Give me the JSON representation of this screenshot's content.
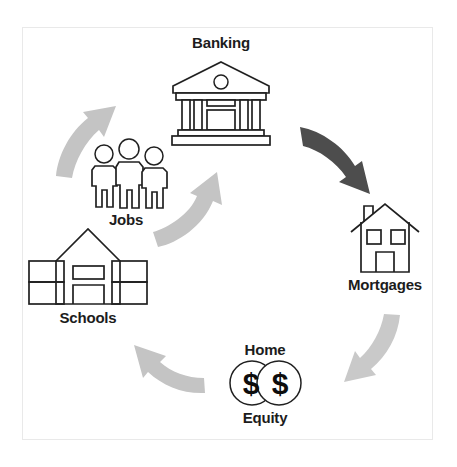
{
  "diagram": {
    "type": "cycle-diagram",
    "title": "",
    "background_color": "#ffffff",
    "frame_color": "#e9e9e9",
    "nodes": [
      {
        "id": "banking",
        "label": "Banking",
        "icon": "bank-building-icon",
        "label_position": "above",
        "cx": 221,
        "cy": 98
      },
      {
        "id": "mortgages",
        "label": "Mortgages",
        "icon": "house-icon",
        "label_position": "below",
        "cx": 385,
        "cy": 243
      },
      {
        "id": "home-equity",
        "label_top": "Home",
        "label_bottom": "Equity",
        "label": "Home Equity",
        "icon": "two-dollar-coins-icon",
        "label_position": "split",
        "cx": 265,
        "cy": 381
      },
      {
        "id": "schools",
        "label": "Schools",
        "icon": "school-building-icon",
        "label_position": "below",
        "cx": 88,
        "cy": 270
      },
      {
        "id": "jobs",
        "label": "Jobs",
        "icon": "three-people-icon",
        "label_position": "below",
        "cx": 126,
        "cy": 175
      }
    ],
    "arrows": [
      {
        "id": "banking-to-mortgages",
        "from": "banking",
        "to": "mortgages",
        "color": "#4d4d4d",
        "emphasis": "highlighted"
      },
      {
        "id": "mortgages-to-home-equity",
        "from": "mortgages",
        "to": "home-equity",
        "color": "#c9c9c9",
        "emphasis": "normal"
      },
      {
        "id": "home-equity-to-schools",
        "from": "home-equity",
        "to": "schools",
        "color": "#c4c4c4",
        "emphasis": "normal"
      },
      {
        "id": "schools-to-jobs",
        "from": "schools",
        "to": "jobs",
        "color": "#c4c4c4",
        "emphasis": "normal"
      },
      {
        "id": "jobs-to-banking",
        "from": "jobs",
        "to": "banking",
        "color": "#c4c4c4",
        "emphasis": "normal"
      }
    ],
    "dollar_symbol": "$",
    "colors": {
      "label_text": "#1c1c1c",
      "icon_stroke": "#202020",
      "arrow_light": "#c4c4c4",
      "arrow_dark": "#4d4d4d"
    }
  }
}
